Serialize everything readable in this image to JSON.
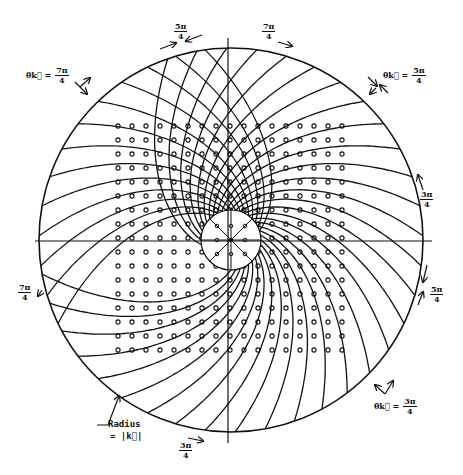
{
  "diagram": {
    "title": "",
    "center": {
      "x": 231,
      "y": 240
    },
    "outer_radius": 192,
    "inner_radius": 30,
    "stroke_color": "#111111",
    "background_color": "#ffffff",
    "axes": {
      "horizontal": {
        "x1": 35,
        "x2": 432,
        "y": 241
      },
      "vertical": {
        "x": 228,
        "y1": 38,
        "y2": 443
      }
    },
    "inner_spokes": 8,
    "dot_grid": {
      "x_start": 118,
      "y_start": 126,
      "spacing": 14,
      "cols": 17,
      "rows": 17
    }
  },
  "labels": {
    "top_left_eq": {
      "prefix": "θk⃗ =",
      "num": "7π",
      "den": "4"
    },
    "top_5pi4": {
      "num": "5π",
      "den": "4"
    },
    "top_7pi4": {
      "num": "7π",
      "den": "4"
    },
    "top_right_eq": {
      "prefix": "θk⃗ =",
      "num": "5π",
      "den": "4"
    },
    "right_3pi4": {
      "num": "3π",
      "den": "4"
    },
    "right_5pi4": {
      "num": "5π",
      "den": "4"
    },
    "left_7pi4": {
      "num": "7π",
      "den": "4"
    },
    "bottom_right_eq": {
      "prefix": "θk⃗ =",
      "num": "3π",
      "den": "4"
    },
    "bottom_3pi4": {
      "num": "3π",
      "den": "4"
    },
    "radius_line1": "Radius",
    "radius_line2": "= |k⃗|"
  }
}
